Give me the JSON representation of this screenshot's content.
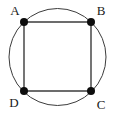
{
  "figure": {
    "name": "square-inscribed-in-circle",
    "caption": "",
    "background_color": "#ffffff",
    "width": 115,
    "height": 118
  },
  "circle": {
    "name": "circumscribed-circle",
    "center_x": 57.5,
    "center_y": 57,
    "radius": 48.5,
    "stroke_color": "#3c3c3c",
    "stroke_width": 1,
    "fill": "none"
  },
  "square": {
    "name": "square-abcd",
    "stroke_color": "#3c3c3c",
    "stroke_width": 1.4,
    "fill": "none",
    "points": "24,22 91,22 91,91 24,91"
  },
  "vertices": [
    {
      "id": "A",
      "label": "A",
      "x": 24,
      "y": 22,
      "label_x": 15,
      "label_y": 15,
      "dot_radius": 4,
      "dot_color": "#0d0d0d"
    },
    {
      "id": "B",
      "label": "B",
      "x": 91,
      "y": 22,
      "label_x": 101,
      "label_y": 15,
      "dot_radius": 4,
      "dot_color": "#0d0d0d"
    },
    {
      "id": "C",
      "label": "C",
      "x": 91,
      "y": 91,
      "label_x": 101,
      "label_y": 109,
      "dot_radius": 4,
      "dot_color": "#0d0d0d"
    },
    {
      "id": "D",
      "label": "D",
      "x": 24,
      "y": 91,
      "label_x": 14,
      "label_y": 107,
      "dot_radius": 4,
      "dot_color": "#0d0d0d"
    }
  ]
}
